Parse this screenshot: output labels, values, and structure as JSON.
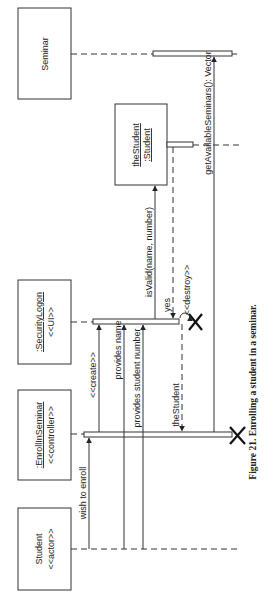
{
  "diagram": {
    "type": "uml-sequence",
    "orientation": "rotated-90-ccw",
    "caption": "Figure 21.  Enrolling a student in a seminar.",
    "participants": [
      {
        "id": "seminar",
        "name": "Seminar",
        "stereotype": ""
      },
      {
        "id": "thestudent",
        "name": "theStudent",
        "name2": ":Student",
        "stereotype": ""
      },
      {
        "id": "securitylogon",
        "name": ":SecurityLogon",
        "stereotype": "<<UI>>"
      },
      {
        "id": "enrollinseminar",
        "name": ":EnrollInSeminar",
        "stereotype": "<<controller>>"
      },
      {
        "id": "student",
        "name": "Student",
        "stereotype": "<<actor>>"
      }
    ],
    "messages": [
      {
        "label": "wish to enroll",
        "from": "student",
        "to": "enrollinseminar",
        "kind": "call"
      },
      {
        "label": "<<create>>",
        "from": "enrollinseminar",
        "to": "securitylogon",
        "kind": "create"
      },
      {
        "label": "provides name",
        "from": "student",
        "to": "securitylogon",
        "kind": "call"
      },
      {
        "label": "provides student number",
        "from": "student",
        "to": "securitylogon",
        "kind": "call"
      },
      {
        "label": "isValid(name, number)",
        "from": "securitylogon",
        "to": "thestudent",
        "kind": "call"
      },
      {
        "label": "yes",
        "from": "thestudent",
        "to": "securitylogon",
        "kind": "return"
      },
      {
        "label": "<<destroy>>",
        "from": "securitylogon",
        "to": "securitylogon",
        "kind": "self-destroy"
      },
      {
        "label": "theStudent",
        "from": "securitylogon",
        "to": "enrollinseminar",
        "kind": "return"
      },
      {
        "label": "getAvailableSeminars(): Vector",
        "from": "enrollinseminar",
        "to": "seminar",
        "kind": "call"
      }
    ]
  }
}
